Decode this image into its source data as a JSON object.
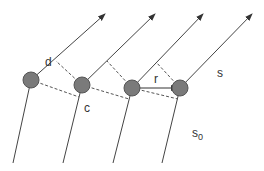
{
  "diagram": {
    "title": "",
    "colors": {
      "line": "#444444",
      "dashed": "#555555",
      "node_fill": "#7a7a7a",
      "node_stroke": "#555555",
      "text": "#333333"
    },
    "nodes": [
      {
        "id": "n1",
        "x": 31,
        "y": 80,
        "r": 8
      },
      {
        "id": "n2",
        "x": 82,
        "y": 85,
        "r": 8
      },
      {
        "id": "n3",
        "x": 132,
        "y": 88,
        "r": 8
      },
      {
        "id": "n4",
        "x": 180,
        "y": 88,
        "r": 8
      }
    ],
    "outgoing_rays": [
      {
        "from": "n1",
        "to": [
          105,
          14
        ]
      },
      {
        "from": "n2",
        "to": [
          155,
          14
        ]
      },
      {
        "from": "n3",
        "to": [
          203,
          14
        ]
      },
      {
        "from": "n4",
        "to": [
          252,
          14
        ]
      }
    ],
    "incoming_rays": [
      {
        "to": "n1",
        "from": [
          13,
          163
        ]
      },
      {
        "to": "n2",
        "from": [
          63,
          163
        ]
      },
      {
        "to": "n3",
        "from": [
          113,
          163
        ]
      },
      {
        "to": "n4",
        "from": [
          162,
          163
        ]
      }
    ],
    "labels": {
      "d": "d",
      "c": "c",
      "r": "r",
      "s": "s",
      "s0_base": "s",
      "s0_sub": "0"
    }
  }
}
